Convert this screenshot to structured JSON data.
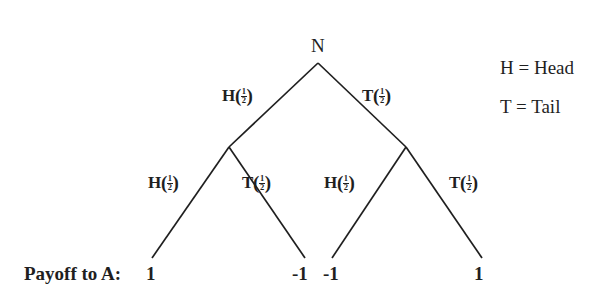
{
  "diagram": {
    "root": {
      "label": "N",
      "x": 318,
      "y": 45
    },
    "level1": [
      {
        "action": "H",
        "probability_num": "1",
        "probability_den": "2",
        "label": "H(1/2)",
        "x": 228,
        "y": 96
      },
      {
        "action": "T",
        "probability_num": "1",
        "probability_den": "2",
        "label": "T(1/2)",
        "x": 368,
        "y": 96
      }
    ],
    "level2": [
      {
        "action": "H",
        "probability_num": "1",
        "probability_den": "2",
        "label": "H(1/2)",
        "x": 152,
        "y": 182
      },
      {
        "action": "T",
        "probability_num": "1",
        "probability_den": "2",
        "label": "T(1/2)",
        "x": 245,
        "y": 182
      },
      {
        "action": "H",
        "probability_num": "1",
        "probability_den": "2",
        "label": "H(1/2)",
        "x": 327,
        "y": 182
      },
      {
        "action": "T",
        "probability_num": "1",
        "probability_den": "2",
        "label": "T(1/2)",
        "x": 452,
        "y": 182
      }
    ],
    "payoff_row_label": "Payoff to A:",
    "payoffs": [
      {
        "value": "1",
        "x": 146
      },
      {
        "value": "-1",
        "x": 292
      },
      {
        "value": "-1",
        "x": 323
      },
      {
        "value": "1",
        "x": 474
      }
    ],
    "legend": [
      {
        "text": "H = Head"
      },
      {
        "text": "T = Tail"
      }
    ],
    "line_color": "#1f1f1f",
    "background_color": "#ffffff",
    "edges": [
      {
        "name": "root-to-left",
        "x1": 318,
        "y1": 63,
        "x2": 229,
        "y2": 147
      },
      {
        "name": "root-to-right",
        "x1": 318,
        "y1": 63,
        "x2": 406,
        "y2": 147
      },
      {
        "name": "left-to-leaf1",
        "x1": 229,
        "y1": 147,
        "x2": 152,
        "y2": 258
      },
      {
        "name": "left-to-leaf2",
        "x1": 229,
        "y1": 147,
        "x2": 305,
        "y2": 258
      },
      {
        "name": "right-to-leaf3",
        "x1": 406,
        "y1": 147,
        "x2": 332,
        "y2": 258
      },
      {
        "name": "right-to-leaf4",
        "x1": 406,
        "y1": 147,
        "x2": 482,
        "y2": 258
      }
    ]
  }
}
